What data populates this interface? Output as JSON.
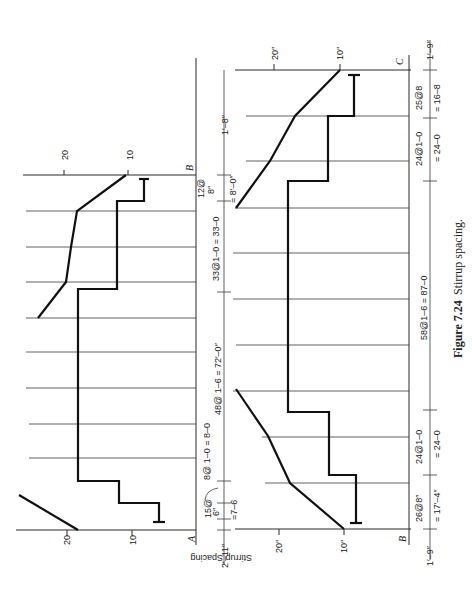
{
  "figure": {
    "number": "Figure 7.24",
    "title": "Stirrup spacing.",
    "orientation": "rotated 90° counterclockwise"
  },
  "axis": {
    "ylabel": "Stirrup Spacing"
  },
  "upper_diagram": {
    "span": "A–B",
    "support_labels": {
      "left": "A",
      "right": "B"
    },
    "tick_labels": [
      "20",
      "10"
    ],
    "tick_labels_top": [
      "20",
      "10"
    ],
    "dimensions": [
      {
        "id": "end_left",
        "label": "2′–11″"
      },
      {
        "id": "seg1",
        "label_top": "15@",
        "label_bot": "6″",
        "total": "=7–6"
      },
      {
        "id": "seg2",
        "label": "8@ 1–0 = 8–0"
      },
      {
        "id": "seg3",
        "label": "48@ 1–6 = 72′–0″"
      },
      {
        "id": "seg4",
        "label": "33@1–0 = 33–0"
      },
      {
        "id": "seg5",
        "label_top": "12@",
        "label_bot": "8″",
        "total": "= 8′–0″"
      },
      {
        "id": "end_right",
        "label": "1′–8″"
      }
    ]
  },
  "lower_diagram": {
    "span": "B–C",
    "support_labels": {
      "left": "B",
      "right": "C"
    },
    "tick_labels": [
      "20″",
      "10″"
    ],
    "tick_labels_top": [
      "20″",
      "10″"
    ],
    "dimensions": [
      {
        "id": "end_left",
        "label": "1′–9″"
      },
      {
        "id": "seg1",
        "label": "26@8″",
        "total": "= 17′–4″"
      },
      {
        "id": "seg2",
        "label": "24@1–0",
        "total": "= 24–0"
      },
      {
        "id": "seg3",
        "label": "58@1–6 = 87–0"
      },
      {
        "id": "seg4",
        "label": "24@1–0",
        "total": "= 24–0"
      },
      {
        "id": "seg5",
        "label": "25@8",
        "total": "= 16–8"
      },
      {
        "id": "end_right",
        "label": "1′–9″"
      }
    ]
  }
}
